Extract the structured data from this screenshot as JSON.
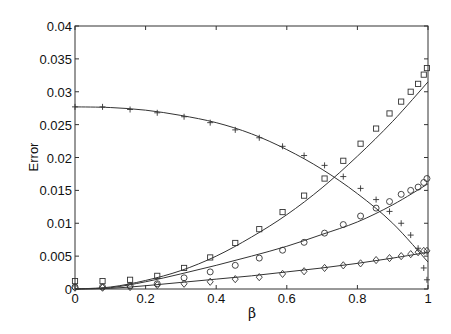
{
  "chart_data": {
    "type": "scatter",
    "title": "",
    "xlabel": "β",
    "ylabel": "Error",
    "xlim": [
      0,
      1
    ],
    "ylim": [
      0,
      0.04
    ],
    "grid": false,
    "legend": "none",
    "x_ticks": [
      0,
      0.2,
      0.4,
      0.6,
      0.8,
      1
    ],
    "x_tick_labels": [
      "0",
      "0.2",
      "0.4",
      "0.6",
      "0.8",
      "1"
    ],
    "y_ticks": [
      0,
      0.005,
      0.01,
      0.015,
      0.02,
      0.025,
      0.03,
      0.035,
      0.04
    ],
    "y_tick_labels": [
      "0",
      "0.005",
      "0.01",
      "0.015",
      "0.02",
      "0.025",
      "0.03",
      "0.035",
      "0.04"
    ],
    "x": [
      0,
      0.078,
      0.156,
      0.233,
      0.309,
      0.383,
      0.454,
      0.522,
      0.588,
      0.649,
      0.707,
      0.76,
      0.809,
      0.853,
      0.891,
      0.924,
      0.951,
      0.972,
      0.988,
      0.997
    ],
    "series": [
      {
        "name": "plus",
        "marker": "plus",
        "values": [
          0.0277,
          0.0277,
          0.0273,
          0.0268,
          0.0262,
          0.0253,
          0.0242,
          0.023,
          0.0217,
          0.0203,
          0.0188,
          0.0171,
          0.0153,
          0.0136,
          0.0118,
          0.01,
          0.0082,
          0.0062,
          0.0032,
          0.0014
        ]
      },
      {
        "name": "square",
        "marker": "square",
        "values": [
          0.0012,
          0.0012,
          0.0014,
          0.002,
          0.0032,
          0.0048,
          0.007,
          0.0091,
          0.0117,
          0.0142,
          0.0168,
          0.0195,
          0.0221,
          0.0244,
          0.0267,
          0.0285,
          0.03,
          0.0312,
          0.0326,
          0.0336
        ]
      },
      {
        "name": "circle",
        "marker": "circle",
        "values": [
          0.0003,
          0.0003,
          0.0005,
          0.0008,
          0.0017,
          0.0026,
          0.0036,
          0.0047,
          0.0059,
          0.0071,
          0.0085,
          0.0098,
          0.0111,
          0.0123,
          0.0133,
          0.0144,
          0.015,
          0.0155,
          0.0162,
          0.0168
        ]
      },
      {
        "name": "diamond",
        "marker": "diamond",
        "values": [
          0.0002,
          0.0002,
          0.0003,
          0.0006,
          0.0008,
          0.0011,
          0.0015,
          0.0018,
          0.0023,
          0.0027,
          0.0032,
          0.0036,
          0.0039,
          0.0044,
          0.0047,
          0.005,
          0.0053,
          0.0056,
          0.0058,
          0.0058
        ]
      }
    ],
    "fit_curves": {
      "x": [
        0,
        0.1,
        0.2,
        0.3,
        0.4,
        0.5,
        0.6,
        0.7,
        0.8,
        0.9,
        1.0
      ],
      "series": [
        {
          "name": "plus-fit",
          "values": [
            0.0277,
            0.0276,
            0.0272,
            0.0264,
            0.0253,
            0.0236,
            0.0212,
            0.0182,
            0.0145,
            0.01,
            0.0041
          ]
        },
        {
          "name": "square-fit",
          "values": [
            0,
            0.0003,
            0.0013,
            0.0028,
            0.005,
            0.0079,
            0.0113,
            0.0154,
            0.0202,
            0.0255,
            0.0315
          ]
        },
        {
          "name": "circle-fit",
          "values": [
            0,
            0.0002,
            0.0011,
            0.0023,
            0.0036,
            0.005,
            0.0065,
            0.0083,
            0.0102,
            0.0128,
            0.016
          ]
        },
        {
          "name": "diamond-fit",
          "values": [
            0,
            0.0001,
            0.0005,
            0.001,
            0.0015,
            0.002,
            0.0026,
            0.0032,
            0.0039,
            0.0047,
            0.0056
          ]
        }
      ]
    },
    "colors": {
      "axes": "#333333",
      "lines": "#333333",
      "markers": "#333333"
    }
  }
}
